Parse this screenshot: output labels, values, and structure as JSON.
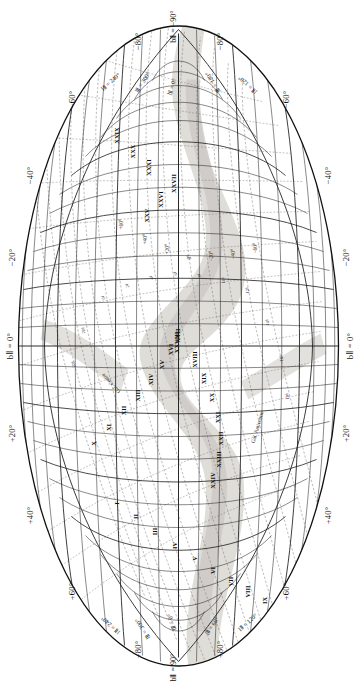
{
  "meta": {
    "figure_type": "all-sky galactic coordinate chart (Aitoff/Hammer equal-area projection)",
    "orientation": "page rotated 90 degrees counter-clockwise relative to chart",
    "background_color": "#ffffff",
    "ink_color": "#111111",
    "milkyway_color": "#d8d6d2"
  },
  "poles": {
    "north": "bⅡ = 90°",
    "south": "bⅡ = −90°"
  },
  "center_labels": {
    "top_axis": "bⅡ = 0°",
    "bottom_axis": "bⅡ = 0°",
    "galactic_centre": "Gal. Centre",
    "galactic_anticentre": "Gal. Anticentre"
  },
  "latitude_ticks_positive": [
    "+20°",
    "+40°",
    "+60°",
    "+80°"
  ],
  "latitude_ticks_negative": [
    "−20°",
    "−40°",
    "−60°",
    "−80°"
  ],
  "longitude_labels": [
    "lⅡ = 0°",
    "lⅡ = 60°",
    "lⅡ = 120°",
    "lⅡ = 180°",
    "lⅡ = 240°",
    "lⅡ = 300°"
  ],
  "equatorial_dec_labels": [
    "+60°",
    "+40°",
    "+20°",
    "0°",
    "−20°",
    "−40°",
    "−60°"
  ],
  "equatorial_ra_labels": [
    "0ʰ",
    "2ʰ",
    "4ʰ",
    "6ʰ",
    "8ʰ",
    "10ʰ",
    "12ʰ",
    "14ʰ",
    "16ʰ",
    "18ʰ",
    "20ʰ",
    "22ʰ"
  ],
  "zone_labels": [
    {
      "id": "I",
      "x": 188,
      "y": 118
    },
    {
      "id": "II",
      "x": 175,
      "y": 137
    },
    {
      "id": "III",
      "x": 160,
      "y": 156
    },
    {
      "id": "IV",
      "x": 146,
      "y": 176
    },
    {
      "id": "V",
      "x": 133,
      "y": 196
    },
    {
      "id": "VI",
      "x": 121,
      "y": 214
    },
    {
      "id": "VII",
      "x": 110,
      "y": 232
    },
    {
      "id": "VIII",
      "x": 100,
      "y": 249
    },
    {
      "id": "IX",
      "x": 91,
      "y": 266
    },
    {
      "id": "X",
      "x": 248,
      "y": 95
    },
    {
      "id": "XI",
      "x": 264,
      "y": 110
    },
    {
      "id": "XII",
      "x": 281,
      "y": 125
    },
    {
      "id": "XIII",
      "x": 296,
      "y": 139
    },
    {
      "id": "XIV",
      "x": 312,
      "y": 152
    },
    {
      "id": "XV",
      "x": 327,
      "y": 163
    },
    {
      "id": "XVI",
      "x": 342,
      "y": 172
    },
    {
      "id": "XVII",
      "x": 356,
      "y": 179
    },
    {
      "id": "XVIII",
      "x": 332,
      "y": 196
    },
    {
      "id": "XIX",
      "x": 313,
      "y": 205
    },
    {
      "id": "XX",
      "x": 294,
      "y": 213
    },
    {
      "id": "XXI",
      "x": 274,
      "y": 219
    },
    {
      "id": "XXII",
      "x": 253,
      "y": 222
    },
    {
      "id": "XXIII",
      "x": 232,
      "y": 220
    },
    {
      "id": "XXIV",
      "x": 211,
      "y": 214
    },
    {
      "id": "XXV",
      "x": 476,
      "y": 148
    },
    {
      "id": "XXVI",
      "x": 492,
      "y": 162
    },
    {
      "id": "XXVII",
      "x": 508,
      "y": 175
    },
    {
      "id": "XXVIII",
      "x": 349,
      "y": 178
    },
    {
      "id": "XXIX",
      "x": 556,
      "y": 118
    },
    {
      "id": "XXX",
      "x": 540,
      "y": 134
    },
    {
      "id": "XXXI",
      "x": 524,
      "y": 150
    }
  ],
  "graticule": {
    "galactic_lat_step_deg": 10,
    "galactic_lon_step_deg": 10,
    "equatorial_dec_step_deg": 10,
    "equatorial_ra_step_hours": 1,
    "galactic_lat_labeled_step_deg": 20,
    "galactic_lon_labeled_step_deg": 60
  },
  "chart_data": {
    "type": "scatter",
    "title": "",
    "xlabel": "Galactic longitude lⅡ (deg)",
    "ylabel": "Galactic latitude bⅡ (deg)",
    "xlim": [
      360,
      0
    ],
    "ylim": [
      -90,
      90
    ],
    "grid": true,
    "legend": "none",
    "projection": "aitoff",
    "x_tick_labels": [
      "0°",
      "60°",
      "120°",
      "180°",
      "240°",
      "300°"
    ],
    "y_tick_labels": [
      "−80°",
      "−60°",
      "−40°",
      "−20°",
      "0°",
      "+20°",
      "+40°",
      "+60°",
      "+80°"
    ],
    "series": [
      {
        "name": "Galactic graticule (solid)",
        "style": "solid-black-lines",
        "description": "galactic latitude parallels every 10 deg and longitude meridians every 10 deg"
      },
      {
        "name": "Equatorial graticule (dashed)",
        "style": "dashed-grey-lines",
        "description": "equatorial declination circles every 10 deg and right ascension hour circles every 1 hour"
      },
      {
        "name": "Milky Way band",
        "style": "light-grey-shaded-band",
        "description": "broad irregular grey band straddling b = 0 deg, widest near the galactic centre"
      },
      {
        "name": "Survey zones",
        "style": "roman-numeral-text-labels",
        "values": [
          "I",
          "II",
          "III",
          "IV",
          "V",
          "VI",
          "VII",
          "VIII",
          "IX",
          "X",
          "XI",
          "XII",
          "XIII",
          "XIV",
          "XV",
          "XVI",
          "XVII",
          "XVIII",
          "XIX",
          "XX",
          "XXI",
          "XXII",
          "XXIII",
          "XXIV",
          "XXV",
          "XXVI",
          "XXVII",
          "XXVIII",
          "XXIX",
          "XXX",
          "XXXI"
        ]
      }
    ],
    "annotations": [
      {
        "text": "Gal. Centre",
        "l": 0,
        "b": 0
      },
      {
        "text": "Gal. Anticentre",
        "l": 180,
        "b": 0
      },
      {
        "text": "bⅡ = 90°",
        "l": 0,
        "b": 90
      },
      {
        "text": "bⅡ = −90°",
        "l": 0,
        "b": -90
      }
    ]
  }
}
